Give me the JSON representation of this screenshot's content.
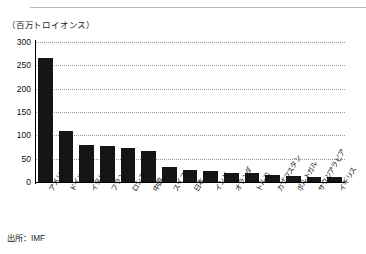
{
  "figure": {
    "unit_label": "（百万トロイオンス）",
    "source_label": "出所：IMF"
  },
  "chart_data": {
    "type": "bar",
    "title": "",
    "subtitle": "",
    "xlabel": "",
    "ylabel": "（百万トロイオンス）",
    "ylim": [
      0,
      300
    ],
    "yticks": [
      0,
      50,
      100,
      150,
      200,
      250,
      300
    ],
    "ytick_labels": [
      "0",
      "50",
      "100",
      "150",
      "200",
      "250",
      "300"
    ],
    "grid": true,
    "grid_axis": "y",
    "legend": false,
    "bar_color": "#151515",
    "categories": [
      "アメリカ",
      "ドイツ",
      "イタリア",
      "フランス",
      "ロシア",
      "中国",
      "スイス",
      "日本",
      "インド",
      "オランダ",
      "トルコ",
      "カザフスタン",
      "ポルトガル",
      "サウジアラビア",
      "イギリス"
    ],
    "values": [
      265,
      109,
      79,
      78,
      73,
      67,
      33,
      25,
      24,
      20,
      19,
      15,
      13,
      10,
      10
    ],
    "source": "出所：IMF"
  }
}
